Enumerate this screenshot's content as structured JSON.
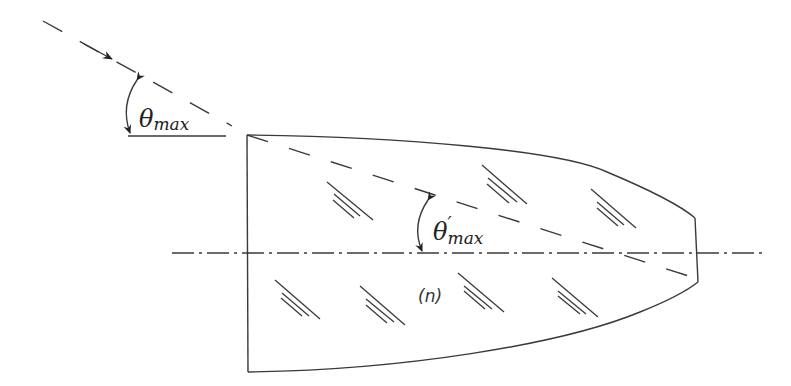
{
  "figure": {
    "labels": {
      "theta_outer_symbol": "θ",
      "theta_outer_sub": "max",
      "theta_inner_symbol": "θ",
      "theta_inner_prime": "′",
      "theta_inner_sub": "max",
      "refractive_index": "(n)"
    },
    "elements": [
      {
        "name": "incident-ray",
        "style": "dashed",
        "arrow": true
      },
      {
        "name": "horizontal-reference-line",
        "style": "solid"
      },
      {
        "name": "rod-body",
        "style": "solid",
        "shape": "curved taper with flat entrance and exit faces"
      },
      {
        "name": "optical-axis",
        "style": "dash-dot"
      },
      {
        "name": "refracted-ray",
        "style": "dashed"
      },
      {
        "name": "angle-arc-outer",
        "label": "θmax"
      },
      {
        "name": "angle-arc-inner",
        "label": "θ′max"
      },
      {
        "name": "hatch-marks",
        "count": 8,
        "meaning": "medium / glass shading"
      }
    ],
    "colors": {
      "line": "#3a3a3a",
      "background": "#ffffff"
    }
  }
}
